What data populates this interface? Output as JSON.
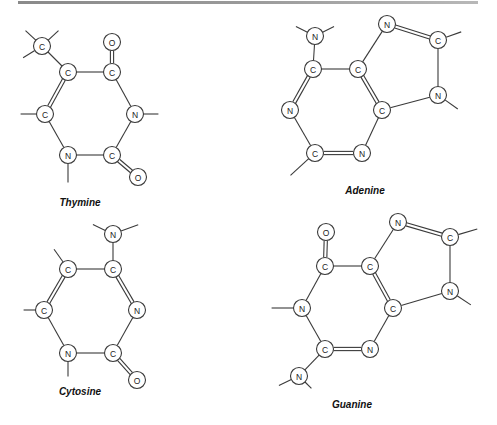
{
  "figure": {
    "atom_radius": 8.5,
    "molecules": [
      {
        "name": "Thymine",
        "label_pos": [
          80,
          206
        ],
        "atoms": [
          {
            "id": "CM",
            "el": "C",
            "x": 42,
            "y": 46
          },
          {
            "id": "C5",
            "el": "C",
            "x": 68,
            "y": 72
          },
          {
            "id": "C4",
            "el": "C",
            "x": 112,
            "y": 72
          },
          {
            "id": "O4",
            "el": "O",
            "x": 112,
            "y": 42
          },
          {
            "id": "N3",
            "el": "N",
            "x": 135,
            "y": 114
          },
          {
            "id": "C2",
            "el": "C",
            "x": 112,
            "y": 155
          },
          {
            "id": "O2",
            "el": "O",
            "x": 138,
            "y": 177
          },
          {
            "id": "N1",
            "el": "N",
            "x": 68,
            "y": 155
          },
          {
            "id": "C6",
            "el": "C",
            "x": 45,
            "y": 114
          }
        ],
        "bonds": [
          {
            "a": "CM",
            "b": "C5",
            "order": 1
          },
          {
            "a": "C5",
            "b": "C4",
            "order": 1
          },
          {
            "a": "C4",
            "b": "O4",
            "order": 2
          },
          {
            "a": "C4",
            "b": "N3",
            "order": 1
          },
          {
            "a": "N3",
            "b": "C2",
            "order": 1
          },
          {
            "a": "C2",
            "b": "O2",
            "order": 2
          },
          {
            "a": "C2",
            "b": "N1",
            "order": 1
          },
          {
            "a": "N1",
            "b": "C6",
            "order": 1
          },
          {
            "a": "C6",
            "b": "C5",
            "order": 2
          }
        ],
        "stubs": [
          {
            "from": "CM",
            "dx": -14,
            "dy": -13
          },
          {
            "from": "CM",
            "dx": 14,
            "dy": -13
          },
          {
            "from": "CM",
            "dx": -16,
            "dy": 10
          },
          {
            "from": "N3",
            "dx": 20,
            "dy": 0
          },
          {
            "from": "N1",
            "dx": 0,
            "dy": 24
          },
          {
            "from": "C6",
            "dx": -21,
            "dy": 0
          }
        ]
      },
      {
        "name": "Adenine",
        "label_pos": [
          365,
          194
        ],
        "atoms": [
          {
            "id": "N6",
            "el": "N",
            "x": 315,
            "y": 36
          },
          {
            "id": "C6",
            "el": "C",
            "x": 313,
            "y": 69
          },
          {
            "id": "C5",
            "el": "C",
            "x": 358,
            "y": 69
          },
          {
            "id": "N7",
            "el": "N",
            "x": 387,
            "y": 24
          },
          {
            "id": "C8",
            "el": "C",
            "x": 438,
            "y": 40
          },
          {
            "id": "N9",
            "el": "N",
            "x": 438,
            "y": 95
          },
          {
            "id": "C4",
            "el": "C",
            "x": 382,
            "y": 110
          },
          {
            "id": "N3",
            "el": "N",
            "x": 362,
            "y": 153
          },
          {
            "id": "C2",
            "el": "C",
            "x": 315,
            "y": 153
          },
          {
            "id": "N1",
            "el": "N",
            "x": 290,
            "y": 110
          }
        ],
        "bonds": [
          {
            "a": "N6",
            "b": "C6",
            "order": 1
          },
          {
            "a": "C6",
            "b": "C5",
            "order": 1
          },
          {
            "a": "C5",
            "b": "N7",
            "order": 1
          },
          {
            "a": "N7",
            "b": "C8",
            "order": 2
          },
          {
            "a": "C8",
            "b": "N9",
            "order": 1
          },
          {
            "a": "N9",
            "b": "C4",
            "order": 1
          },
          {
            "a": "C4",
            "b": "C5",
            "order": 2
          },
          {
            "a": "C4",
            "b": "N3",
            "order": 1
          },
          {
            "a": "N3",
            "b": "C2",
            "order": 2
          },
          {
            "a": "C2",
            "b": "N1",
            "order": 1
          },
          {
            "a": "N1",
            "b": "C6",
            "order": 2
          }
        ],
        "stubs": [
          {
            "from": "N6",
            "dx": -16,
            "dy": -8
          },
          {
            "from": "N6",
            "dx": 16,
            "dy": -8
          },
          {
            "from": "C8",
            "dx": 20,
            "dy": -7
          },
          {
            "from": "N9",
            "dx": 17,
            "dy": 12
          },
          {
            "from": "C2",
            "dx": -22,
            "dy": 20
          }
        ]
      },
      {
        "name": "Cytosine",
        "label_pos": [
          80,
          395
        ],
        "atoms": [
          {
            "id": "N4",
            "el": "N",
            "x": 113,
            "y": 234
          },
          {
            "id": "C4",
            "el": "C",
            "x": 113,
            "y": 269
          },
          {
            "id": "C5",
            "el": "C",
            "x": 68,
            "y": 269
          },
          {
            "id": "C6",
            "el": "C",
            "x": 44,
            "y": 310
          },
          {
            "id": "N3",
            "el": "N",
            "x": 137,
            "y": 310
          },
          {
            "id": "C2",
            "el": "C",
            "x": 113,
            "y": 353
          },
          {
            "id": "O2",
            "el": "O",
            "x": 137,
            "y": 380
          },
          {
            "id": "N1",
            "el": "N",
            "x": 68,
            "y": 353
          }
        ],
        "bonds": [
          {
            "a": "N4",
            "b": "C4",
            "order": 1
          },
          {
            "a": "C4",
            "b": "C5",
            "order": 1
          },
          {
            "a": "C4",
            "b": "N3",
            "order": 2
          },
          {
            "a": "N3",
            "b": "C2",
            "order": 1
          },
          {
            "a": "C2",
            "b": "O2",
            "order": 2
          },
          {
            "a": "C2",
            "b": "N1",
            "order": 1
          },
          {
            "a": "N1",
            "b": "C6",
            "order": 1
          },
          {
            "a": "C6",
            "b": "C5",
            "order": 2
          }
        ],
        "stubs": [
          {
            "from": "N4",
            "dx": -17,
            "dy": -8
          },
          {
            "from": "N4",
            "dx": 22,
            "dy": -8
          },
          {
            "from": "C5",
            "dx": -12,
            "dy": -17
          },
          {
            "from": "C6",
            "dx": -17,
            "dy": 0
          },
          {
            "from": "N1",
            "dx": 0,
            "dy": 20
          }
        ]
      },
      {
        "name": "Guanine",
        "label_pos": [
          352,
          408
        ],
        "atoms": [
          {
            "id": "O6",
            "el": "O",
            "x": 326,
            "y": 232
          },
          {
            "id": "C6",
            "el": "C",
            "x": 325,
            "y": 266
          },
          {
            "id": "C5",
            "el": "C",
            "x": 370,
            "y": 266
          },
          {
            "id": "N7",
            "el": "N",
            "x": 398,
            "y": 222
          },
          {
            "id": "C8",
            "el": "C",
            "x": 450,
            "y": 237
          },
          {
            "id": "N9",
            "el": "N",
            "x": 450,
            "y": 291
          },
          {
            "id": "C4",
            "el": "C",
            "x": 393,
            "y": 308
          },
          {
            "id": "N3",
            "el": "N",
            "x": 370,
            "y": 349
          },
          {
            "id": "C2",
            "el": "C",
            "x": 325,
            "y": 349
          },
          {
            "id": "N1",
            "el": "N",
            "x": 302,
            "y": 308
          },
          {
            "id": "N2",
            "el": "N",
            "x": 299,
            "y": 376
          }
        ],
        "bonds": [
          {
            "a": "O6",
            "b": "C6",
            "order": 2
          },
          {
            "a": "C6",
            "b": "C5",
            "order": 1
          },
          {
            "a": "C5",
            "b": "N7",
            "order": 1
          },
          {
            "a": "N7",
            "b": "C8",
            "order": 2
          },
          {
            "a": "C8",
            "b": "N9",
            "order": 1
          },
          {
            "a": "N9",
            "b": "C4",
            "order": 1
          },
          {
            "a": "C4",
            "b": "C5",
            "order": 2
          },
          {
            "a": "C4",
            "b": "N3",
            "order": 1
          },
          {
            "a": "N3",
            "b": "C2",
            "order": 2
          },
          {
            "a": "C2",
            "b": "N1",
            "order": 1
          },
          {
            "a": "N1",
            "b": "C6",
            "order": 1
          },
          {
            "a": "C2",
            "b": "N2",
            "order": 1
          }
        ],
        "stubs": [
          {
            "from": "C8",
            "dx": 24,
            "dy": -7
          },
          {
            "from": "N9",
            "dx": 18,
            "dy": 12
          },
          {
            "from": "N1",
            "dx": -27,
            "dy": 0
          },
          {
            "from": "N2",
            "dx": -17,
            "dy": 8
          },
          {
            "from": "N2",
            "dx": 10,
            "dy": 10
          }
        ]
      }
    ]
  }
}
